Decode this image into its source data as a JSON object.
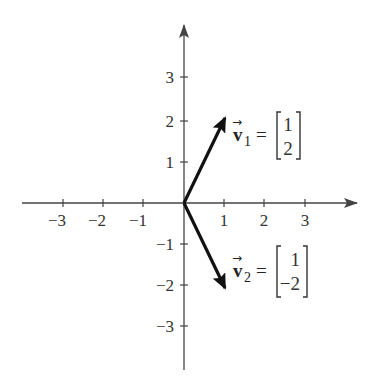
{
  "diagram": {
    "type": "coordinate-plane-vectors",
    "colors": {
      "axis": "#444444",
      "vector": "#111111",
      "text": "#333333",
      "background": "#ffffff"
    },
    "x_axis": {
      "ticks": [
        -3,
        -2,
        -1,
        1,
        2,
        3
      ],
      "tick_labels": [
        "−3",
        "−2",
        "−1",
        "1",
        "2",
        "3"
      ]
    },
    "y_axis": {
      "ticks": [
        3,
        2,
        1,
        -1,
        -2,
        -3
      ],
      "tick_labels": [
        "3",
        "2",
        "1",
        "−1",
        "−2",
        "−3"
      ]
    },
    "vectors": [
      {
        "name": "v",
        "subscript": "1",
        "components": [
          "1",
          "2"
        ],
        "from": [
          0,
          0
        ],
        "to": [
          1,
          2
        ],
        "equals": "="
      },
      {
        "name": "v",
        "subscript": "2",
        "components": [
          "1",
          "−2"
        ],
        "from": [
          0,
          0
        ],
        "to": [
          1,
          -2
        ],
        "equals": "="
      }
    ]
  }
}
